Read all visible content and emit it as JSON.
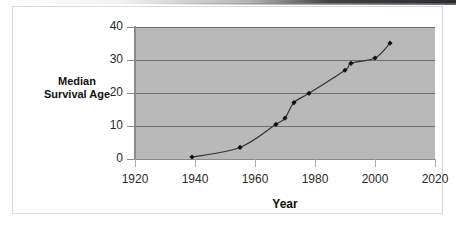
{
  "chart_data": {
    "type": "line",
    "title": "",
    "xlabel": "Year",
    "ylabel": "Median Survival Age",
    "ylabel_line1": "Median",
    "ylabel_line2": "Survival Age",
    "xlim": [
      1920,
      2020
    ],
    "ylim": [
      0,
      40
    ],
    "xticks": [
      1920,
      1940,
      1960,
      1980,
      2000,
      2020
    ],
    "xtick_labels": [
      "1920",
      "1940",
      "1960",
      "1980",
      "2000",
      "2020"
    ],
    "yticks": [
      0,
      10,
      20,
      30,
      40
    ],
    "ytick_labels": [
      "0",
      "10",
      "20",
      "30",
      "40"
    ],
    "grid": "horizontal",
    "legend": "none",
    "marker": "diamond",
    "marker_color": "#111111",
    "line_color": "#333333",
    "plot_background": "#b9b9b9",
    "gridline_color": "#6e6e6e",
    "series": [
      {
        "name": "Median Survival Age",
        "x": [
          1939,
          1955,
          1967,
          1970,
          1973,
          1978,
          1990,
          1992,
          2000,
          2005
        ],
        "values": [
          0.6,
          3.5,
          10.5,
          12.4,
          17.1,
          19.9,
          26.9,
          29.0,
          30.6,
          35.1
        ]
      }
    ]
  }
}
